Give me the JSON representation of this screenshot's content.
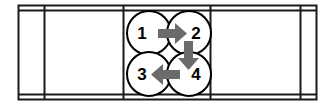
{
  "diagram": {
    "type": "schematic",
    "colors": {
      "background": "#ffffff",
      "frame_line": "#1a1a1a",
      "circle_stroke": "#000000",
      "circle_fill": "#ffffff",
      "arrow_fill": "#6b6b6b",
      "label_text": "#000000"
    },
    "frame": {
      "name": "outer-frame",
      "x": 18,
      "y": 5,
      "width": 299,
      "height": 95,
      "inner_offset": 5,
      "stroke_width": 2,
      "dividers": [
        44,
        123,
        210,
        300
      ]
    },
    "panels": [
      {
        "name": "panel-far-left",
        "x": 18,
        "width": 26
      },
      {
        "name": "panel-left",
        "x": 44,
        "width": 79
      },
      {
        "name": "panel-center",
        "x": 123,
        "width": 87
      },
      {
        "name": "panel-right",
        "x": 210,
        "width": 90
      },
      {
        "name": "panel-far-right",
        "x": 300,
        "width": 17
      }
    ],
    "circles": [
      {
        "id": "circle-1",
        "label": "1",
        "cx": 149,
        "cy": 33,
        "r": 22
      },
      {
        "id": "circle-2",
        "label": "2",
        "cx": 189,
        "cy": 33,
        "r": 22
      },
      {
        "id": "circle-3",
        "label": "3",
        "cx": 149,
        "cy": 74,
        "r": 22
      },
      {
        "id": "circle-4",
        "label": "4",
        "cx": 189,
        "cy": 74,
        "r": 22
      }
    ],
    "arrows": [
      {
        "id": "arrow-1-to-2",
        "from": "1",
        "to": "2",
        "direction": "right",
        "shaft": {
          "x": 158,
          "y": 29,
          "width": 17,
          "height": 9
        },
        "head": {
          "points": "175,23 187,33.5 175,44"
        }
      },
      {
        "id": "arrow-2-to-4",
        "from": "2",
        "to": "4",
        "direction": "down",
        "shaft": {
          "x": 184,
          "y": 41,
          "width": 9,
          "height": 17
        },
        "head": {
          "points": "178,58 199,58 188.5,70"
        }
      },
      {
        "id": "arrow-4-to-3",
        "from": "4",
        "to": "3",
        "direction": "left",
        "shaft": {
          "x": 163,
          "y": 70,
          "width": 17,
          "height": 9
        },
        "head": {
          "points": "163,64 163,85 151,74.5"
        }
      }
    ],
    "sequence": [
      "1",
      "2",
      "4",
      "3"
    ]
  }
}
